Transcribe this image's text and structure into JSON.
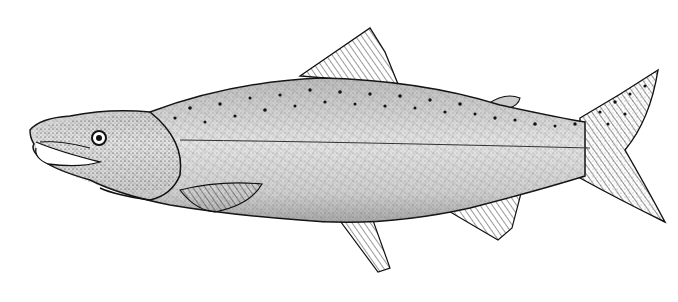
{
  "image": {
    "subject": "Salmon",
    "style": "black-and-white stipple illustration",
    "alt": "Stipple drawing of a salmon facing left with hooked jaw, spotted back, and forked tail",
    "colors": {
      "ink": "#111111",
      "background": "#ffffff",
      "shade": "#9a9a9a"
    }
  }
}
